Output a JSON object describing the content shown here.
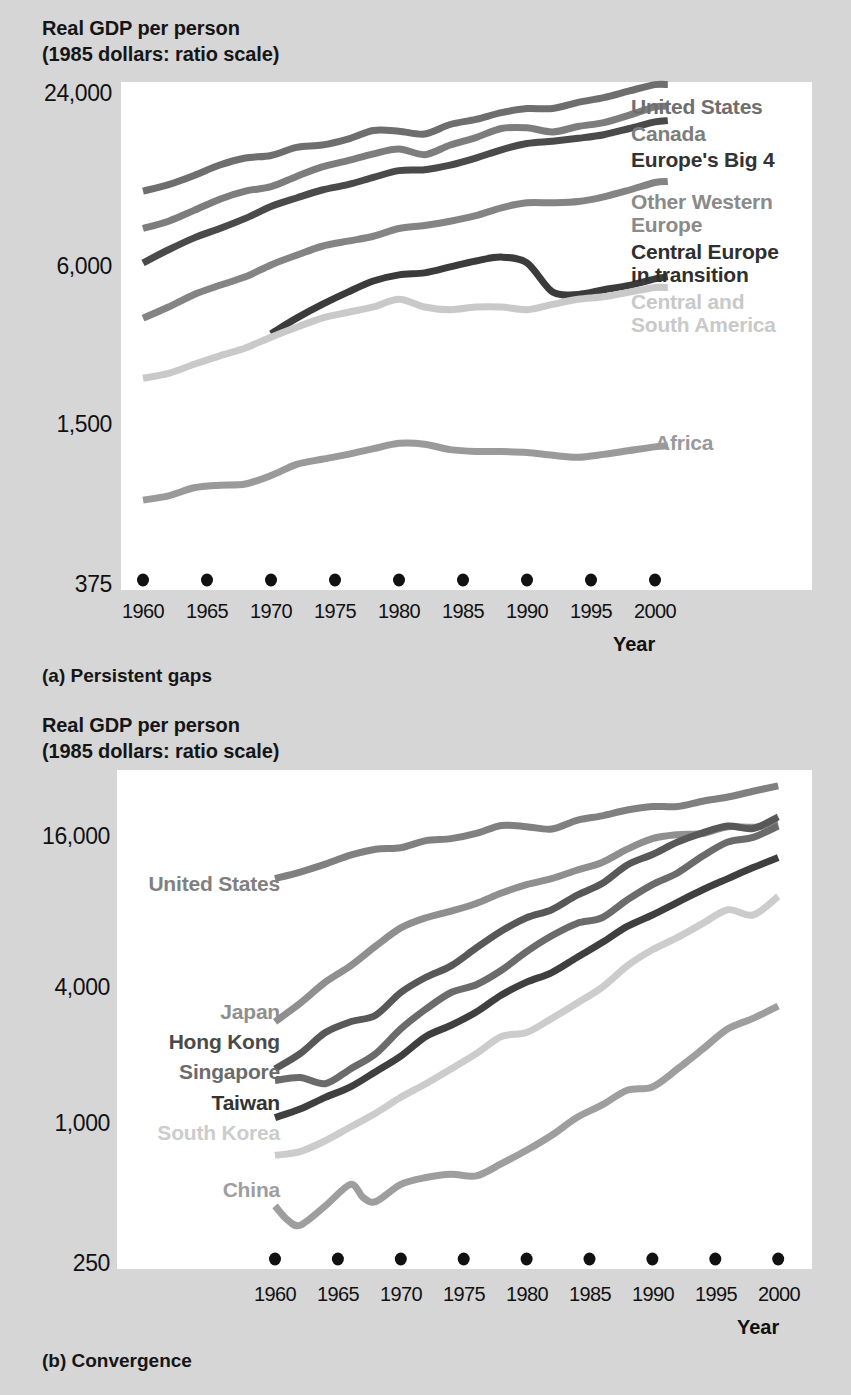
{
  "figure": {
    "background_color": "#d6d6d6",
    "plot_background_color": "#ffffff"
  },
  "panel_a": {
    "axis_title": "Real GDP per person\n(1985 dollars: ratio scale)",
    "caption": "(a) Persistent gaps",
    "x_axis_name": "Year",
    "y_ticks": [
      "24,000",
      "6,000",
      "1,500",
      "375"
    ],
    "x_ticks": [
      "1960",
      "1965",
      "1970",
      "1975",
      "1980",
      "1985",
      "1990",
      "1995",
      "2000"
    ],
    "labels": {
      "united_states": "United States",
      "canada": "Canada",
      "europes_big_4": "Europe's Big 4",
      "other_western_europe": "Other Western\nEurope",
      "central_europe": "Central Europe\nin transition",
      "central_south_america": "Central and\nSouth America",
      "africa": "Africa"
    }
  },
  "panel_b": {
    "axis_title": "Real GDP per person\n(1985 dollars: ratio scale)",
    "caption": "(b) Convergence",
    "x_axis_name": "Year",
    "y_ticks": [
      "16,000",
      "4,000",
      "1,000",
      "250"
    ],
    "x_ticks": [
      "1960",
      "1965",
      "1970",
      "1975",
      "1980",
      "1985",
      "1990",
      "1995",
      "2000"
    ],
    "labels": {
      "united_states": "United States",
      "japan": "Japan",
      "hong_kong": "Hong Kong",
      "singapore": "Singapore",
      "taiwan": "Taiwan",
      "south_korea": "South Korea",
      "china": "China"
    }
  },
  "chart_data": [
    {
      "type": "line",
      "id": "panel-a",
      "title": "Real GDP per person (1985 dollars: ratio scale)",
      "subtitle": "(a) Persistent gaps",
      "xlabel": "Year",
      "ylabel": "Real GDP per person (1985 dollars: ratio scale)",
      "yscale": "log",
      "ylim": [
        375,
        28000
      ],
      "xlim": [
        1960,
        2002
      ],
      "yticks": [
        375,
        1500,
        6000,
        24000
      ],
      "xticks": [
        1960,
        1965,
        1970,
        1975,
        1980,
        1985,
        1990,
        1995,
        2000
      ],
      "grid": false,
      "legend": "inline-right",
      "series": [
        {
          "name": "United States",
          "color": "#6e6e6e",
          "x": [
            1960,
            1962,
            1964,
            1966,
            1968,
            1970,
            1972,
            1974,
            1976,
            1978,
            1980,
            1982,
            1984,
            1986,
            1988,
            1990,
            1992,
            1994,
            1996,
            1998,
            2000,
            2001
          ],
          "values": [
            11200,
            11800,
            12700,
            13800,
            14600,
            14900,
            15900,
            16200,
            17000,
            18200,
            18100,
            17700,
            19100,
            19900,
            21000,
            21700,
            21700,
            22800,
            23700,
            25000,
            26300,
            26300
          ]
        },
        {
          "name": "Canada",
          "color": "#7d7d7d",
          "x": [
            1960,
            1962,
            1964,
            1966,
            1968,
            1970,
            1972,
            1974,
            1976,
            1978,
            1980,
            1982,
            1984,
            1986,
            1988,
            1990,
            1992,
            1994,
            1996,
            1998,
            2000,
            2001
          ],
          "values": [
            8300,
            8800,
            9600,
            10500,
            11200,
            11600,
            12600,
            13600,
            14300,
            15100,
            15700,
            15000,
            16200,
            17200,
            18500,
            18600,
            18000,
            18800,
            19400,
            20600,
            22000,
            22100
          ]
        },
        {
          "name": "Europe's Big 4",
          "color": "#4a4a4a",
          "x": [
            1960,
            1962,
            1964,
            1966,
            1968,
            1970,
            1972,
            1974,
            1976,
            1978,
            1980,
            1982,
            1984,
            1986,
            1988,
            1990,
            1992,
            1994,
            1996,
            1998,
            2000,
            2001
          ],
          "values": [
            6300,
            7000,
            7700,
            8300,
            9000,
            9900,
            10600,
            11300,
            11800,
            12500,
            13200,
            13300,
            13800,
            14600,
            15600,
            16400,
            16700,
            17100,
            17600,
            18500,
            19500,
            19700
          ]
        },
        {
          "name": "Other Western Europe",
          "color": "#848484",
          "x": [
            1960,
            1962,
            1964,
            1966,
            1968,
            1970,
            1972,
            1974,
            1976,
            1978,
            1980,
            1982,
            1984,
            1986,
            1988,
            1990,
            1992,
            1994,
            1996,
            1998,
            2000,
            2001
          ],
          "values": [
            3900,
            4300,
            4800,
            5200,
            5600,
            6200,
            6700,
            7200,
            7500,
            7800,
            8300,
            8500,
            8800,
            9200,
            9800,
            10200,
            10200,
            10300,
            10700,
            11300,
            12000,
            12100
          ]
        },
        {
          "name": "Central Europe in transition",
          "color": "#3b3b3b",
          "x": [
            1970,
            1972,
            1974,
            1976,
            1978,
            1980,
            1982,
            1984,
            1986,
            1988,
            1990,
            1992,
            1994,
            1996,
            1998,
            2000,
            2001
          ],
          "values": [
            3400,
            3900,
            4400,
            4900,
            5400,
            5700,
            5800,
            6100,
            6400,
            6600,
            6300,
            4900,
            4800,
            5000,
            5200,
            5500,
            5600
          ]
        },
        {
          "name": "Central and South America",
          "color": "#c9c9c9",
          "x": [
            1960,
            1962,
            1964,
            1966,
            1968,
            1970,
            1972,
            1974,
            1976,
            1978,
            1980,
            1982,
            1984,
            1986,
            1988,
            1990,
            1992,
            1994,
            1996,
            1998,
            2000,
            2001
          ],
          "values": [
            2300,
            2400,
            2600,
            2800,
            3000,
            3300,
            3600,
            3900,
            4100,
            4300,
            4600,
            4300,
            4200,
            4300,
            4300,
            4200,
            4400,
            4600,
            4700,
            4900,
            5100,
            5100
          ]
        },
        {
          "name": "Africa",
          "color": "#9a9a9a",
          "x": [
            1960,
            1962,
            1964,
            1966,
            1968,
            1970,
            1972,
            1974,
            1976,
            1978,
            1980,
            1982,
            1984,
            1986,
            1988,
            1990,
            1992,
            1994,
            1996,
            1998,
            2000,
            2001
          ],
          "values": [
            790,
            820,
            880,
            900,
            910,
            980,
            1080,
            1130,
            1180,
            1240,
            1300,
            1290,
            1230,
            1210,
            1210,
            1200,
            1170,
            1150,
            1180,
            1220,
            1260,
            1270
          ]
        }
      ]
    },
    {
      "type": "line",
      "id": "panel-b",
      "title": "Real GDP per person (1985 dollars: ratio scale)",
      "subtitle": "(b) Convergence",
      "xlabel": "Year",
      "ylabel": "Real GDP per person (1985 dollars: ratio scale)",
      "yscale": "log",
      "ylim": [
        250,
        22000
      ],
      "xlim": [
        1958,
        2001
      ],
      "yticks": [
        250,
        1000,
        4000,
        16000
      ],
      "xticks": [
        1960,
        1965,
        1970,
        1975,
        1980,
        1985,
        1990,
        1995,
        2000
      ],
      "grid": false,
      "legend": "inline-left",
      "series": [
        {
          "name": "United States",
          "color": "#808080",
          "x": [
            1960,
            1962,
            1964,
            1966,
            1968,
            1970,
            1972,
            1974,
            1976,
            1978,
            1980,
            1982,
            1984,
            1986,
            1988,
            1990,
            1992,
            1994,
            1996,
            1998,
            2000
          ],
          "values": [
            11200,
            11900,
            12800,
            13900,
            14700,
            14900,
            15900,
            16200,
            17000,
            18300,
            18100,
            17700,
            19200,
            20000,
            21100,
            21800,
            21800,
            22900,
            23800,
            25100,
            26400
          ]
        },
        {
          "name": "Japan",
          "color": "#8f8f8f",
          "x": [
            1960,
            1962,
            1964,
            1966,
            1968,
            1970,
            1972,
            1974,
            1976,
            1978,
            1980,
            1982,
            1984,
            1986,
            1988,
            1990,
            1992,
            1994,
            1996,
            1998,
            2000
          ],
          "values": [
            2900,
            3500,
            4300,
            5000,
            6000,
            7100,
            7800,
            8300,
            8900,
            9800,
            10600,
            11200,
            12100,
            13000,
            14700,
            16200,
            16800,
            17000,
            18100,
            18000,
            18600
          ]
        },
        {
          "name": "Hong Kong",
          "color": "#585858",
          "x": [
            1960,
            1962,
            1964,
            1966,
            1968,
            1970,
            1972,
            1974,
            1976,
            1978,
            1980,
            1982,
            1984,
            1986,
            1988,
            1990,
            1992,
            1994,
            1996,
            1998,
            2000
          ],
          "values": [
            1800,
            2100,
            2600,
            2900,
            3100,
            3900,
            4500,
            5000,
            5900,
            6900,
            7800,
            8400,
            9600,
            10700,
            12700,
            14000,
            15700,
            17100,
            18200,
            17800,
            19800
          ]
        },
        {
          "name": "Singapore",
          "color": "#6b6b6b",
          "x": [
            1960,
            1962,
            1964,
            1966,
            1968,
            1970,
            1972,
            1974,
            1976,
            1978,
            1980,
            1982,
            1984,
            1986,
            1988,
            1990,
            1992,
            1994,
            1996,
            1998,
            2000
          ],
          "values": [
            1600,
            1650,
            1550,
            1800,
            2100,
            2700,
            3300,
            3900,
            4200,
            4800,
            5700,
            6600,
            7400,
            7800,
            9200,
            10600,
            11800,
            13800,
            15700,
            16400,
            18200
          ]
        },
        {
          "name": "Taiwan",
          "color": "#3f3f3f",
          "x": [
            1960,
            1962,
            1964,
            1966,
            1968,
            1970,
            1972,
            1974,
            1976,
            1978,
            1980,
            1982,
            1984,
            1986,
            1988,
            1990,
            1992,
            1994,
            1996,
            1998,
            2000
          ],
          "values": [
            1100,
            1200,
            1350,
            1500,
            1750,
            2050,
            2500,
            2800,
            3200,
            3800,
            4300,
            4700,
            5400,
            6200,
            7200,
            8000,
            9000,
            10100,
            11200,
            12400,
            13600
          ]
        },
        {
          "name": "South Korea",
          "color": "#cccccc",
          "x": [
            1960,
            1962,
            1964,
            1966,
            1968,
            1970,
            1972,
            1974,
            1976,
            1978,
            1980,
            1982,
            1984,
            1986,
            1988,
            1990,
            1992,
            1994,
            1996,
            1998,
            2000
          ],
          "values": [
            750,
            780,
            870,
            1000,
            1150,
            1350,
            1550,
            1800,
            2100,
            2500,
            2600,
            3000,
            3500,
            4100,
            5000,
            5800,
            6500,
            7400,
            8400,
            8000,
            9500
          ]
        },
        {
          "name": "China",
          "color": "#9e9e9e",
          "x": [
            1960,
            1961,
            1962,
            1964,
            1966,
            1967,
            1968,
            1970,
            1972,
            1974,
            1976,
            1978,
            1980,
            1982,
            1984,
            1986,
            1988,
            1990,
            1992,
            1994,
            1996,
            1998,
            2000
          ],
          "values": [
            450,
            390,
            370,
            450,
            560,
            490,
            470,
            560,
            600,
            620,
            610,
            690,
            790,
            920,
            1100,
            1250,
            1450,
            1500,
            1800,
            2200,
            2700,
            3000,
            3400
          ]
        }
      ]
    }
  ]
}
